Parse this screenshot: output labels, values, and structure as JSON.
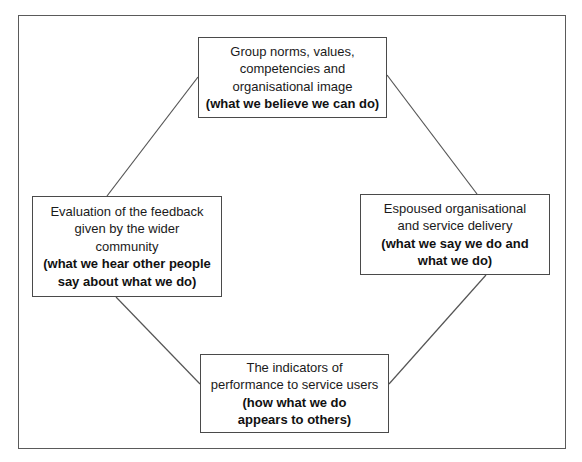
{
  "diagram": {
    "type": "cycle",
    "nodes": [
      {
        "id": "top",
        "lines": [
          "Group norms, values,",
          "competencies and",
          "organisational image"
        ],
        "bold_lines": [
          "(what we believe we can do)"
        ]
      },
      {
        "id": "right",
        "lines": [
          "Espoused organisational",
          "and service delivery"
        ],
        "bold_lines": [
          "(what we say we do and",
          "what we do)"
        ]
      },
      {
        "id": "bottom",
        "lines": [
          "The indicators of",
          "performance to service users"
        ],
        "bold_lines": [
          "(how what we do",
          "appears to others)"
        ]
      },
      {
        "id": "left",
        "lines": [
          "Evaluation of the feedback",
          "given by the wider",
          "community"
        ],
        "bold_lines": [
          "(what we hear other people",
          "say about what we do)"
        ]
      }
    ],
    "edges": [
      {
        "from": "top",
        "to": "right"
      },
      {
        "from": "right",
        "to": "bottom"
      },
      {
        "from": "bottom",
        "to": "left"
      },
      {
        "from": "left",
        "to": "top"
      }
    ],
    "colors": {
      "background": "#ffffff",
      "border": "#4a4a4a",
      "line": "#555555",
      "text": "#1a1a1a"
    }
  }
}
